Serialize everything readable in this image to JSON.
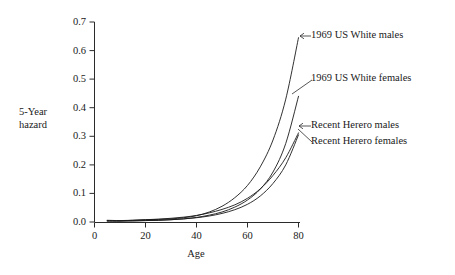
{
  "chart_data": {
    "type": "line",
    "title": "",
    "xlabel": "Age",
    "ylabel": "5-Year\nhazard",
    "ylabel_line1": "5-Year",
    "ylabel_line2": "hazard",
    "xlim": [
      0,
      85
    ],
    "ylim": [
      0.0,
      0.7
    ],
    "grid": false,
    "legend_position": "inline-annotations",
    "x_ticks": [
      "0",
      "20",
      "40",
      "60",
      "80"
    ],
    "x_tick_values": [
      0,
      20,
      40,
      60,
      80
    ],
    "y_ticks": [
      "0.0",
      "0.1",
      "0.2",
      "0.3",
      "0.4",
      "0.5",
      "0.6",
      "0.7"
    ],
    "y_tick_values": [
      0.0,
      0.1,
      0.2,
      0.3,
      0.4,
      0.5,
      0.6,
      0.7
    ],
    "x": [
      5,
      10,
      15,
      20,
      25,
      30,
      35,
      40,
      45,
      50,
      55,
      60,
      65,
      70,
      75,
      80
    ],
    "series": [
      {
        "name": "1969 US White males",
        "color": "#1a1a1a",
        "values": [
          0.004,
          0.004,
          0.006,
          0.008,
          0.009,
          0.011,
          0.015,
          0.022,
          0.035,
          0.055,
          0.085,
          0.128,
          0.193,
          0.287,
          0.43,
          0.645
        ]
      },
      {
        "name": "1969 US White females",
        "color": "#1a1a1a",
        "values": [
          0.003,
          0.003,
          0.004,
          0.005,
          0.006,
          0.008,
          0.011,
          0.016,
          0.024,
          0.035,
          0.052,
          0.077,
          0.115,
          0.175,
          0.275,
          0.44
        ]
      },
      {
        "name": "Recent Herero males",
        "color": "#1a1a1a",
        "values": [
          0.006,
          0.005,
          0.006,
          0.008,
          0.01,
          0.013,
          0.017,
          0.023,
          0.032,
          0.044,
          0.06,
          0.083,
          0.116,
          0.163,
          0.225,
          0.312
        ]
      },
      {
        "name": "Recent Herero females",
        "color": "#1a1a1a",
        "values": [
          0.005,
          0.004,
          0.004,
          0.005,
          0.006,
          0.008,
          0.011,
          0.015,
          0.021,
          0.03,
          0.043,
          0.062,
          0.091,
          0.135,
          0.2,
          0.305
        ]
      }
    ],
    "annotations": [
      {
        "label": "1969 US White males",
        "target_x": 79,
        "target_y": 0.63
      },
      {
        "label": "1969 US White females",
        "target_x": 79,
        "target_y": 0.435
      },
      {
        "label": "Recent Herero males",
        "target_x": 79.5,
        "target_y": 0.305
      },
      {
        "label": "Recent Herero females",
        "target_x": 79,
        "target_y": 0.285
      }
    ]
  }
}
